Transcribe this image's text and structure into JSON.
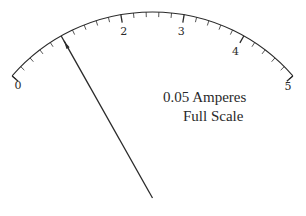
{
  "meter": {
    "type": "analog-ammeter-dial",
    "scale_min": 0,
    "scale_max": 5,
    "major_labels": [
      "0",
      "1",
      "2",
      "3",
      "4",
      "5"
    ],
    "visible_labels": [
      "0",
      "2",
      "3",
      "4",
      "5"
    ],
    "minor_divisions_per_major": 5,
    "needle_value": 1,
    "caption_line1": "0.05 Amperes",
    "caption_line2": "Full Scale",
    "colors": {
      "ink": "#2a2a2a",
      "background": "#ffffff"
    }
  },
  "chart_data": {
    "type": "gauge",
    "scale_range": [
      0,
      5
    ],
    "tick_labels": [
      "0",
      "1",
      "2",
      "3",
      "4",
      "5"
    ],
    "major_tick_step": 1,
    "minor_tick_step": 0.2,
    "needle_reading": 1,
    "full_scale_current_amperes": 0.05,
    "needle_current_amperes": 0.01
  }
}
